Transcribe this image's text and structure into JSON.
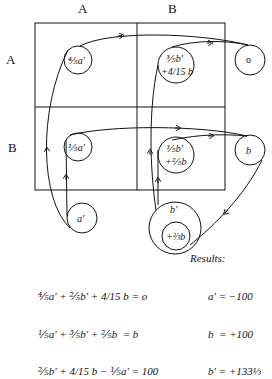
{
  "column_labels": [
    "A",
    "B"
  ],
  "row_labels": [
    "A",
    "B"
  ],
  "nodes": {
    "AA": "⅘a′",
    "AB_line1": "⅗b′",
    "AB_line2": "+4/15 b",
    "A_out": "o",
    "BA": "⅕a′",
    "BB_line1": "⅗b′",
    "BB_line2": "+⅖b",
    "B_out": "b",
    "a_prime": "a′",
    "b_prime": "b′",
    "b_prime_inner": "+⅔b"
  },
  "equations": [
    "⅘a′ + ⅖b′ + 4/15 b = o",
    "⅕a′ + ⅗b′ + ⅖b  = b",
    "⅖b′ + 4/15 b − ⅕a′ = 100"
  ],
  "results": {
    "title": "Results:",
    "lines": [
      "a′ = −100",
      "b  = +100",
      "b′ = +133⅓"
    ]
  }
}
